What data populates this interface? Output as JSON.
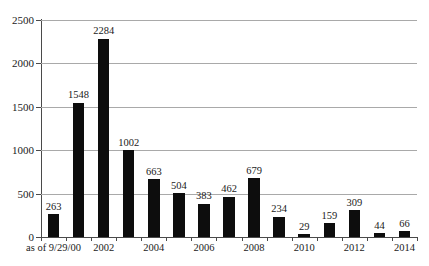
{
  "chart_data": {
    "type": "bar",
    "title": "",
    "subtitle": "",
    "xlabel": "",
    "ylabel": "",
    "ylim": [
      0,
      2500
    ],
    "yticks": [
      0,
      500,
      1000,
      1500,
      2000,
      2500
    ],
    "ytick_labels": [
      "0",
      "500",
      "1000",
      "1500",
      "2000",
      "2500"
    ],
    "grid": true,
    "legend": "none",
    "bar_color": "#0d0d0d",
    "gridline_color": "#a9a9a9",
    "axis_color": "#4a4a4a",
    "categories": [
      "as of 9/29/00",
      "2001",
      "2002",
      "2003",
      "2004",
      "2005",
      "2006",
      "2007",
      "2008",
      "2009",
      "2010",
      "2011",
      "2012",
      "2013",
      "2014"
    ],
    "visible_tick_labels": [
      "as of 9/29/00",
      "",
      "2002",
      "",
      "2004",
      "",
      "2006",
      "",
      "2008",
      "",
      "2010",
      "",
      "2012",
      "",
      "2014"
    ],
    "values": [
      263,
      1548,
      2284,
      1002,
      663,
      504,
      383,
      462,
      679,
      234,
      29,
      159,
      309,
      44,
      66
    ],
    "data_labels": [
      "263",
      "1548",
      "2284",
      "1002",
      "663",
      "504",
      "383",
      "462",
      "679",
      "234",
      "29",
      "159",
      "309",
      "44",
      "66"
    ]
  }
}
